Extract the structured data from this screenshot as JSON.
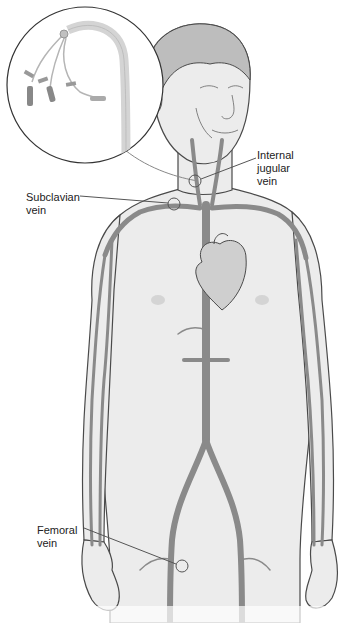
{
  "figure": {
    "colors": {
      "background": "#ffffff",
      "skin": "#ececec",
      "skin_shade": "#d9d9d9",
      "outline": "#4a4a4a",
      "vein": "#8a8a8a",
      "vein_dark": "#6e6e6e",
      "heart": "#cfcfcf",
      "catheter": "#d4d4d4",
      "label_text": "#222222",
      "leader_line": "#555555"
    },
    "inset": {
      "name": "central-venous-catheter-inset",
      "description": "Magnified view of multi-lumen catheter with three hub lines"
    },
    "labels": [
      {
        "id": "internal-jugular-vein",
        "text": "Internal\njugular\nvein"
      },
      {
        "id": "subclavian-vein",
        "text": "Subclavian\nvein"
      },
      {
        "id": "femoral-vein",
        "text": "Femoral\nvein"
      }
    ],
    "anatomy": [
      "head",
      "neck",
      "torso",
      "heart",
      "left-arm",
      "right-arm",
      "pelvis",
      "left-leg",
      "right-leg",
      "vena-cava",
      "iliac-veins"
    ]
  }
}
